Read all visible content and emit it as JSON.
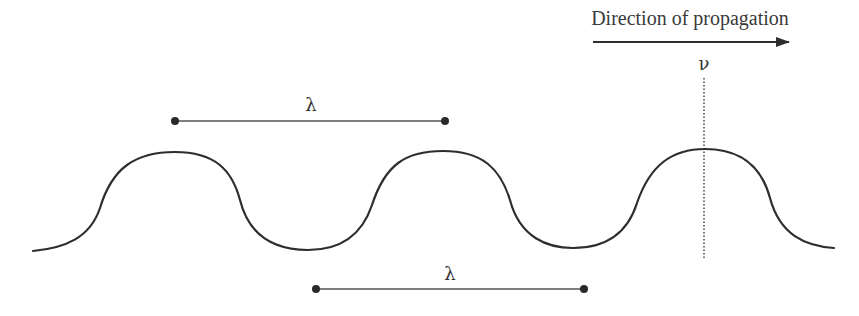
{
  "diagram": {
    "title": "Direction of propagation",
    "velocity_label": "ν",
    "wavelength_top_label": "λ",
    "wavelength_bottom_label": "λ",
    "colors": {
      "stroke": "#2e2e2e",
      "text": "#333333",
      "background": "#ffffff"
    },
    "wave": {
      "crests_x": [
        175,
        443,
        705
      ],
      "troughs_x": [
        308,
        573
      ],
      "crest_y": 151,
      "trough_y": 250,
      "start": [
        33,
        251
      ],
      "end": [
        834,
        248
      ]
    },
    "wavelength_markers": [
      {
        "label": "λ",
        "x1": 175,
        "x2": 445,
        "y": 121
      },
      {
        "label": "λ",
        "x1": 316,
        "x2": 584,
        "y": 289
      }
    ],
    "propagation_arrow": {
      "x1": 593,
      "x2": 790,
      "y": 42
    },
    "reference_line": {
      "x": 704,
      "y1": 77,
      "y2": 260,
      "style": "dotted"
    }
  }
}
